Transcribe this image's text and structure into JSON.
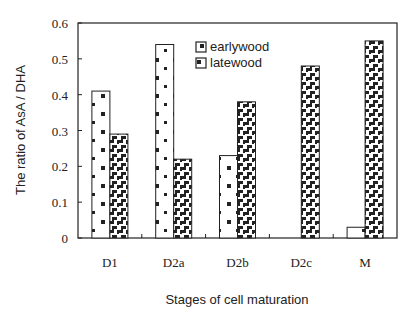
{
  "chart_data": {
    "type": "bar",
    "title": "",
    "xlabel": "Stages of cell maturation",
    "ylabel": "The ratio of  AsA / DHA",
    "categories": [
      "D1",
      "D2a",
      "D2b",
      "D2c",
      "M"
    ],
    "series": [
      {
        "name": "earlywood",
        "pattern": "dots",
        "values": [
          0.41,
          0.54,
          0.23,
          0.0,
          0.03
        ]
      },
      {
        "name": "latewood",
        "pattern": "zigzag",
        "values": [
          0.29,
          0.22,
          0.38,
          0.48,
          0.55
        ]
      }
    ],
    "ylim": [
      0,
      0.6
    ],
    "yticks": [
      "0",
      "0.1",
      "0.2",
      "0.3",
      "0.4",
      "0.5",
      "0.6"
    ],
    "grid": false,
    "legend_position": "upper-center-inside"
  },
  "legend": {
    "items": [
      {
        "label": "earlywood"
      },
      {
        "label": "latewood"
      }
    ]
  },
  "colors": {
    "ink": "#222222",
    "background": "#ffffff"
  }
}
